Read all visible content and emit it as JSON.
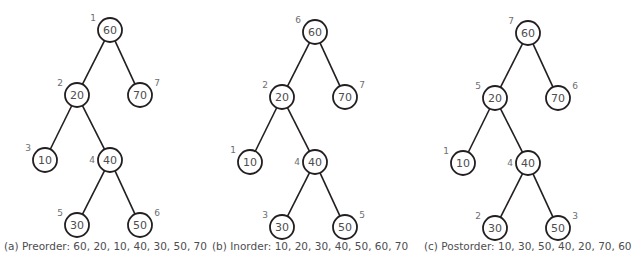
{
  "figures": [
    {
      "id": "a",
      "offset_x": 0,
      "offset_y": 0,
      "caption": "(a) Preorder: 60, 20, 10, 40, 30, 50, 70",
      "caption_x": 4,
      "traversal": "Preorder",
      "sequence": [
        60,
        20,
        10,
        40,
        30,
        50,
        70
      ],
      "orders": {
        "60": "1",
        "20": "2",
        "10": "3",
        "40": "4",
        "30": "5",
        "50": "6",
        "70": "7"
      }
    },
    {
      "id": "b",
      "offset_x": 205,
      "offset_y": 2,
      "caption": "(b) Inorder: 10, 20, 30, 40, 50, 60, 70",
      "caption_x": 212,
      "traversal": "Inorder",
      "sequence": [
        10,
        20,
        30,
        40,
        50,
        60,
        70
      ],
      "orders": {
        "60": "6",
        "20": "2",
        "10": "1",
        "40": "4",
        "30": "3",
        "50": "5",
        "70": "7"
      }
    },
    {
      "id": "c",
      "offset_x": 418,
      "offset_y": 3,
      "caption": "(c) Postorder: 10, 30, 50, 40, 20, 70, 60",
      "caption_x": 424,
      "traversal": "Postorder",
      "sequence": [
        10,
        30,
        50,
        40,
        20,
        70,
        60
      ],
      "orders": {
        "60": "7",
        "20": "5",
        "10": "1",
        "40": "4",
        "30": "2",
        "50": "3",
        "70": "6"
      }
    }
  ],
  "tree": {
    "nodes": [
      {
        "value": "60",
        "x": 110,
        "y": 30,
        "label_side": "left"
      },
      {
        "value": "20",
        "x": 77,
        "y": 95,
        "label_side": "left"
      },
      {
        "value": "70",
        "x": 140,
        "y": 95,
        "label_side": "right"
      },
      {
        "value": "10",
        "x": 45,
        "y": 160,
        "label_side": "left"
      },
      {
        "value": "40",
        "x": 110,
        "y": 160,
        "label_side": "left-mid"
      },
      {
        "value": "30",
        "x": 77,
        "y": 225,
        "label_side": "left"
      },
      {
        "value": "50",
        "x": 140,
        "y": 225,
        "label_side": "right"
      }
    ],
    "edges": [
      [
        "60",
        "20"
      ],
      [
        "60",
        "70"
      ],
      [
        "20",
        "10"
      ],
      [
        "20",
        "40"
      ],
      [
        "40",
        "30"
      ],
      [
        "40",
        "50"
      ]
    ],
    "radius": 12
  },
  "colors": {
    "stroke": "#231f20",
    "text": "#4d4d4f",
    "order_label": "#6d6e71"
  }
}
